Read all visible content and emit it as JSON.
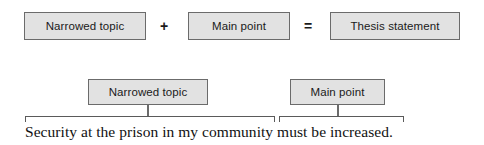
{
  "diagram": {
    "colors": {
      "box_fill": "#e2e2e2",
      "box_border": "#6b6b6b",
      "bracket": "#5a5a5a",
      "text": "#1a1a1a",
      "background": "#ffffff"
    },
    "formula_row": {
      "boxes": [
        {
          "label": "Narrowed topic"
        },
        {
          "label": "Main point"
        },
        {
          "label": "Thesis statement"
        }
      ],
      "operators": [
        {
          "symbol": "+",
          "name": "plus"
        },
        {
          "symbol": "=",
          "name": "equals"
        }
      ]
    },
    "example_row": {
      "boxes": [
        {
          "label": "Narrowed topic"
        },
        {
          "label": "Main point"
        }
      ]
    },
    "example_sentence": {
      "full_text": "Security at the prison in my community must be increased.",
      "narrowed_topic_part": "Security at the prison in my community",
      "main_point_part": "must be increased."
    }
  }
}
